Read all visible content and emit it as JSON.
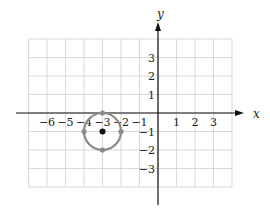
{
  "diagram": {
    "type": "coordinate-plane-circle",
    "axes": {
      "x_label": "x",
      "y_label": "y",
      "x_ticks": [
        {
          "value": -6,
          "label": "−6"
        },
        {
          "value": -5,
          "label": "−5"
        },
        {
          "value": -4,
          "label": "−4"
        },
        {
          "value": -3,
          "label": "−3"
        },
        {
          "value": -2,
          "label": "−2"
        },
        {
          "value": -1,
          "label": "−1"
        },
        {
          "value": 1,
          "label": "1"
        },
        {
          "value": 2,
          "label": "2"
        },
        {
          "value": 3,
          "label": "3"
        }
      ],
      "y_ticks": [
        {
          "value": 3,
          "label": "3"
        },
        {
          "value": 2,
          "label": "2"
        },
        {
          "value": 1,
          "label": "1"
        },
        {
          "value": -1,
          "label": "−1"
        },
        {
          "value": -2,
          "label": "−2"
        },
        {
          "value": -3,
          "label": "−3"
        }
      ],
      "grid": {
        "x_min": -7,
        "x_max": 4,
        "y_min": -4,
        "y_max": 4
      }
    },
    "circle": {
      "center": {
        "x": -3,
        "y": -1
      },
      "radius": 1,
      "points": [
        {
          "name": "top",
          "x": -3,
          "y": 0
        },
        {
          "name": "bottom",
          "x": -3,
          "y": -2
        },
        {
          "name": "left",
          "x": -4,
          "y": -1
        },
        {
          "name": "right",
          "x": -2,
          "y": -1
        }
      ]
    },
    "colors": {
      "grid": "#cfcfcf",
      "axis": "#111111",
      "circle": "#8a8a8a",
      "center": "#111111"
    }
  }
}
